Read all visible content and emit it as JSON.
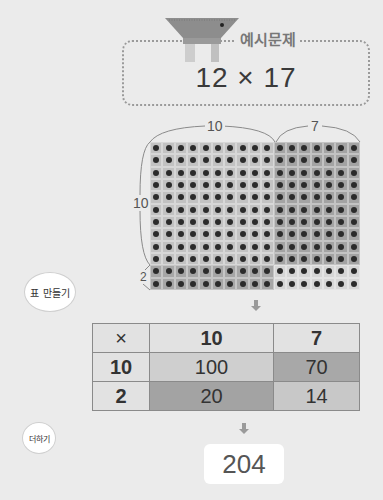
{
  "header": {
    "label": "예시문제",
    "problem": "12 × 17"
  },
  "array_model": {
    "top_labels": [
      "10",
      "7"
    ],
    "side_labels": [
      "10",
      "2"
    ],
    "columns_split": [
      10,
      7
    ],
    "rows_split": [
      10,
      2
    ]
  },
  "steps": {
    "make_table": "표 만들기",
    "add": "더하기"
  },
  "table": {
    "corner": "×",
    "col_headers": [
      "10",
      "7"
    ],
    "rows": [
      {
        "header": "10",
        "cells": [
          "100",
          "70"
        ]
      },
      {
        "header": "2",
        "cells": [
          "20",
          "14"
        ]
      }
    ]
  },
  "result": "204",
  "colors": {
    "background": "#ebebeb",
    "region_10x10": "#c2c2c2",
    "region_10x7": "#a3a3a3",
    "region_2x10": "#a6a6a6",
    "region_2x7": "#d6d6d6"
  }
}
